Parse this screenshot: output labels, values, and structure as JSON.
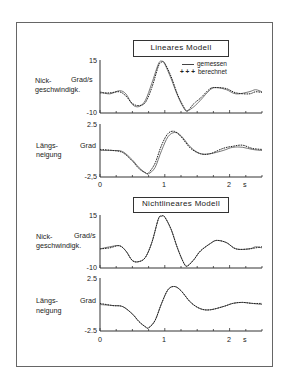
{
  "figure": {
    "title_linear": "Lineares Modell",
    "title_nonlinear": "Nichtlineares Modell",
    "legend": {
      "measured": "gemessen",
      "computed": "berechnet",
      "computed_marker": "+ + +"
    },
    "x_unit": "s",
    "x_ticks": [
      "0",
      "1",
      "2"
    ],
    "nick": {
      "label_line1": "Nick-",
      "label_line2": "geschwindigk.",
      "unit": "Grad/s",
      "ymax": "15",
      "ymin": "-10"
    },
    "laengs": {
      "label_line1": "Längs-",
      "label_line2": "neigung",
      "unit": "Grad",
      "ymax": "2.5",
      "ymin": "-2,5",
      "ymax_alt": "2.5",
      "ymin_alt": "-2.5"
    }
  },
  "chart_data": [
    {
      "type": "line",
      "title": "Lineares Modell – Nickgeschwindigkeit",
      "xlabel": "s",
      "ylabel": "Grad/s",
      "xlim": [
        0,
        2.5
      ],
      "ylim": [
        -10,
        15
      ],
      "legend_position": "upper right",
      "x": [
        0,
        0.15,
        0.3,
        0.4,
        0.5,
        0.6,
        0.7,
        0.8,
        0.9,
        0.95,
        1.0,
        1.1,
        1.2,
        1.3,
        1.35,
        1.45,
        1.55,
        1.7,
        1.8,
        1.95,
        2.1,
        2.3,
        2.4,
        2.5
      ],
      "series": [
        {
          "name": "gemessen",
          "values": [
            0,
            -1,
            0.5,
            -1,
            -6,
            -7,
            -4,
            4,
            13,
            14.5,
            13,
            6,
            -2,
            -8,
            -9,
            -7,
            -4,
            1,
            2,
            1,
            -1,
            0,
            1,
            0
          ]
        },
        {
          "name": "berechnet",
          "values": [
            -0.5,
            -0.5,
            0,
            -2,
            -5.5,
            -6.5,
            -5,
            2,
            12,
            14,
            13.5,
            7,
            -1.5,
            -7.5,
            -9,
            -5.5,
            -3,
            1.5,
            2,
            1.5,
            -0.5,
            -1,
            0,
            -0.3
          ]
        }
      ]
    },
    {
      "type": "line",
      "title": "Lineares Modell – Längsneigung",
      "xlabel": "s",
      "ylabel": "Grad",
      "xlim": [
        0,
        2.5
      ],
      "ylim": [
        -2.5,
        2.5
      ],
      "x": [
        0,
        0.2,
        0.35,
        0.5,
        0.6,
        0.7,
        0.75,
        0.85,
        0.95,
        1.05,
        1.15,
        1.25,
        1.4,
        1.55,
        1.7,
        1.9,
        2.05,
        2.2,
        2.35,
        2.5
      ],
      "series": [
        {
          "name": "gemessen",
          "values": [
            0,
            0,
            -0.1,
            -0.9,
            -1.6,
            -2.1,
            -2.2,
            -1.6,
            0,
            1.3,
            1.7,
            1.4,
            0.3,
            -0.3,
            -0.3,
            0,
            0.3,
            0.3,
            0.1,
            0
          ]
        },
        {
          "name": "berechnet",
          "values": [
            0.1,
            0,
            -0.2,
            -1.0,
            -1.7,
            -2.1,
            -2.1,
            -1.2,
            0.5,
            1.6,
            1.8,
            1.3,
            0.2,
            -0.3,
            -0.3,
            0.2,
            0.4,
            0.5,
            0.2,
            0.1
          ]
        }
      ]
    },
    {
      "type": "line",
      "title": "Nichtlineares Modell – Nickgeschwindigkeit",
      "xlabel": "s",
      "ylabel": "Grad/s",
      "xlim": [
        0,
        2.5
      ],
      "ylim": [
        -10,
        15
      ],
      "x": [
        0,
        0.15,
        0.3,
        0.4,
        0.5,
        0.6,
        0.7,
        0.8,
        0.9,
        0.95,
        1.0,
        1.1,
        1.2,
        1.3,
        1.35,
        1.45,
        1.55,
        1.7,
        1.8,
        1.95,
        2.1,
        2.3,
        2.4,
        2.5
      ],
      "series": [
        {
          "name": "gemessen",
          "values": [
            -1,
            0,
            0.5,
            -2,
            -6.5,
            -7,
            -5,
            2,
            13,
            14.5,
            14,
            8,
            -1,
            -8,
            -9,
            -6,
            -2,
            1.5,
            3,
            2,
            -1,
            -1,
            0,
            -0.5
          ]
        },
        {
          "name": "berechnet",
          "values": [
            -1,
            -0.5,
            0.5,
            -2,
            -6.5,
            -7,
            -5,
            2,
            13,
            14.5,
            14,
            8,
            -1,
            -8,
            -9,
            -6,
            -2,
            1.5,
            3,
            2,
            -1,
            -1,
            -0.5,
            0
          ]
        }
      ]
    },
    {
      "type": "line",
      "title": "Nichtlineares Modell – Längsneigung",
      "xlabel": "s",
      "ylabel": "Grad",
      "xlim": [
        0,
        2.5
      ],
      "ylim": [
        -2.5,
        2.5
      ],
      "x": [
        0,
        0.2,
        0.35,
        0.5,
        0.6,
        0.7,
        0.75,
        0.85,
        0.95,
        1.05,
        1.15,
        1.25,
        1.4,
        1.55,
        1.7,
        1.9,
        2.05,
        2.2,
        2.35,
        2.5
      ],
      "series": [
        {
          "name": "gemessen",
          "values": [
            0,
            -0.1,
            -0.2,
            -0.9,
            -1.6,
            -2.1,
            -2.2,
            -1.5,
            0.1,
            1.4,
            1.7,
            1.3,
            0.2,
            -0.4,
            -0.5,
            -0.2,
            0.1,
            0.2,
            0.1,
            0
          ]
        },
        {
          "name": "berechnet",
          "values": [
            0.1,
            -0.1,
            -0.2,
            -0.9,
            -1.6,
            -2.1,
            -2.2,
            -1.5,
            0.1,
            1.4,
            1.7,
            1.3,
            0.2,
            -0.4,
            -0.5,
            -0.2,
            0.1,
            0.2,
            0.1,
            0.1
          ]
        }
      ]
    }
  ]
}
